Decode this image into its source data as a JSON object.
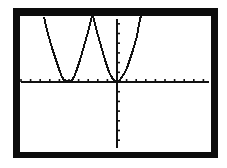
{
  "chart_data": {
    "type": "line",
    "title": "",
    "xlabel": "",
    "ylabel": "",
    "xlim": [
      -10,
      10
    ],
    "ylim": [
      -7,
      7
    ],
    "xscale_tick": 1,
    "yscale_tick": 1,
    "grid": false,
    "legend": null,
    "series": [
      {
        "name": "y1",
        "x": [
          -7.5,
          -7.1,
          -6.6,
          -6.2,
          -5.8,
          -5.5,
          -5.1,
          -4.6,
          -4.2,
          -3.8,
          -3.3,
          -2.9,
          -2.6,
          -2.5,
          -2.3,
          -2.0,
          -1.6,
          -1.2,
          -0.7,
          -0.3,
          0.0,
          0.5,
          1.0,
          1.5,
          1.9,
          2.3,
          2.6
        ],
        "y": [
          6.6,
          5.0,
          3.5,
          2.3,
          1.0,
          0.3,
          0.1,
          0.2,
          1.0,
          2.3,
          3.7,
          5.1,
          6.3,
          6.7,
          6.3,
          5.1,
          3.7,
          2.3,
          1.0,
          0.3,
          0.0,
          0.5,
          1.4,
          2.7,
          4.0,
          5.4,
          6.5
        ]
      }
    ]
  },
  "screen": {
    "frame_color": "#0c0c0c",
    "background_color": "#ffffff",
    "axis_color": "#111111",
    "curve_color": "#111111"
  },
  "plot_pixels": {
    "axis_origin": [
      117,
      82
    ],
    "x_axis_range_px": [
      21,
      209
    ],
    "y_axis_range_px": [
      19,
      148
    ],
    "tick_spacing_x_px": 9.6,
    "tick_spacing_y_px": 9.7,
    "curve_points": "44,17 46,26 48,34 50,41 52,48 54,54 56,60 58,66 60,72 62,77 64,80 67,81 70,81 72,80 74,77 76,72 78,66 80,60 82,53 84,46 86,39 88,32 90,24 91,20 92,16 93,16 94,20 95,24 97,32 99,39 101,46 103,53 105,60 107,66 109,72 111,76 113,79 115,81 117,82 119,81 122,77 125,72 127,68 129,62 131,56 133,50 135,43 137,36 138,30 139,25 140,19 141,16"
  }
}
